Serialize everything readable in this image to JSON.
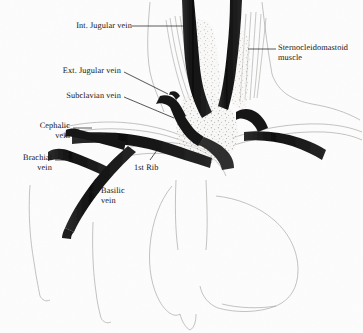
{
  "figure": {
    "kind": "anatomical-illustration",
    "medium": "pencil and ink drawing on paper",
    "background_color": "#fdfdfd",
    "ink_color": "#141414",
    "vessel_fill_color": "#1a1a1a",
    "faint_line_color": "#9a9a96"
  },
  "labels": [
    {
      "id": "int-jugular-vein",
      "text": "Int. Jugular vein",
      "align": "right",
      "x": 75,
      "y": 22,
      "leader": "horizontal line running right to the dark vertical vessel"
    },
    {
      "id": "ext-jugular-vein",
      "text": "Ext. Jugular vein",
      "align": "right",
      "x": 66,
      "y": 68,
      "leader": "line angling down-right to the branching dark vessel"
    },
    {
      "id": "subclavian-vein",
      "text": "Subclavian vein",
      "align": "right",
      "x": 66,
      "y": 93,
      "leader": "line angling down-right to the dark vessel junction"
    },
    {
      "id": "sternocleidomastoid-muscle",
      "text": "Sternocleidomastoid\nmuscle",
      "align": "left",
      "x": 278,
      "y": 45,
      "leader": "horizontal line running left to the muscle body"
    },
    {
      "id": "cephalic-vein",
      "text": "Cephalic\nvein",
      "align": "right",
      "x": 28,
      "y": 122,
      "leader": "line running right to the upper dark vein branch"
    },
    {
      "id": "brachial-vein",
      "text": "Brachial\nvein",
      "align": "right",
      "x": 16,
      "y": 155,
      "leader": "line running right to the middle dark vein branch"
    },
    {
      "id": "basilic-vein",
      "text": "Basilic\nvein",
      "align": "left",
      "x": 101,
      "y": 188,
      "leader": "short line running left to the long descending dark vein"
    },
    {
      "id": "first-rib",
      "text": "1st Rib",
      "align": "left",
      "x": 134,
      "y": 165,
      "leader": "short line angling up-right to the rib outline"
    }
  ]
}
